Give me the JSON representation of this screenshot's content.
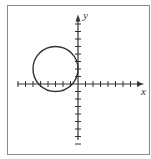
{
  "chart_data": {
    "type": "line",
    "title": "",
    "xlabel": "x",
    "ylabel": "y",
    "xlim": [
      -8,
      8
    ],
    "ylim": [
      -8,
      9
    ],
    "grid": false,
    "ticks": {
      "x_spacing_units": 1,
      "y_spacing_units": 1,
      "labels_shown": false
    },
    "series": [
      {
        "name": "circle",
        "shape": "circle",
        "center": [
          -3,
          2
        ],
        "radius": 3,
        "equation": "(x+3)^2 + (y-2)^2 = 9",
        "tangent_to": "y-axis at (0, 2)"
      }
    ]
  },
  "labels": {
    "x": "x",
    "y": "y"
  },
  "colors": {
    "stroke": "#333333",
    "frame": "#8a8a8a"
  }
}
